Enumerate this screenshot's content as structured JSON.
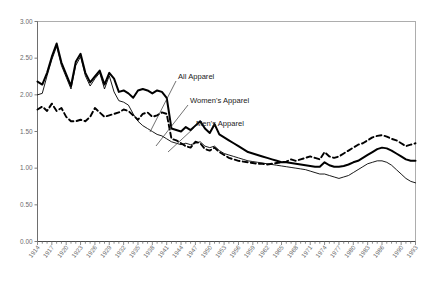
{
  "chart_data": {
    "type": "line",
    "title": "",
    "xlabel": "",
    "ylabel": "",
    "ylim": [
      0,
      3.0
    ],
    "yticks": [
      "0.00",
      "0.50",
      "1.00",
      "1.50",
      "2.00",
      "2.50",
      "3.00"
    ],
    "ytick_values": [
      0,
      0.5,
      1.0,
      1.5,
      2.0,
      2.5,
      3.0
    ],
    "grid": false,
    "legend_position": "inline-annotations",
    "xlim": [
      1914,
      1993
    ],
    "x": [
      1914,
      1915,
      1916,
      1917,
      1918,
      1919,
      1920,
      1921,
      1922,
      1923,
      1924,
      1925,
      1926,
      1927,
      1928,
      1929,
      1930,
      1931,
      1932,
      1933,
      1934,
      1935,
      1936,
      1937,
      1938,
      1939,
      1940,
      1941,
      1942,
      1943,
      1944,
      1945,
      1946,
      1947,
      1948,
      1949,
      1950,
      1951,
      1952,
      1953,
      1954,
      1955,
      1956,
      1957,
      1958,
      1959,
      1960,
      1961,
      1962,
      1963,
      1964,
      1965,
      1966,
      1967,
      1968,
      1969,
      1970,
      1971,
      1972,
      1973,
      1974,
      1975,
      1976,
      1977,
      1978,
      1979,
      1980,
      1981,
      1982,
      1983,
      1984,
      1985,
      1986,
      1987,
      1988,
      1989,
      1990,
      1991,
      1992,
      1993
    ],
    "xtick_labels": [
      "1914",
      "1917",
      "1920",
      "1923",
      "1926",
      "1929",
      "1932",
      "1935",
      "1938",
      "1941",
      "1944",
      "1947",
      "1950",
      "1953",
      "1956",
      "1959",
      "1962",
      "1965",
      "1968",
      "1971",
      "1974",
      "1977",
      "1980",
      "1983",
      "1986",
      "1990",
      "1993"
    ],
    "xtick_years": [
      1914,
      1917,
      1920,
      1923,
      1926,
      1929,
      1932,
      1935,
      1938,
      1941,
      1944,
      1947,
      1950,
      1953,
      1956,
      1959,
      1962,
      1965,
      1968,
      1971,
      1974,
      1977,
      1980,
      1983,
      1986,
      1990,
      1993
    ],
    "series": [
      {
        "name": "All Apparel",
        "style": "thick-solid",
        "color": "#000000",
        "values": [
          2.18,
          2.14,
          2.3,
          2.52,
          2.7,
          2.44,
          2.28,
          2.12,
          2.45,
          2.56,
          2.3,
          2.17,
          2.25,
          2.33,
          2.14,
          2.3,
          2.22,
          2.04,
          2.06,
          2.02,
          1.96,
          2.06,
          2.08,
          2.06,
          2.02,
          2.06,
          2.04,
          1.96,
          1.54,
          1.52,
          1.5,
          1.56,
          1.52,
          1.58,
          1.64,
          1.54,
          1.48,
          1.6,
          1.46,
          1.42,
          1.38,
          1.34,
          1.3,
          1.26,
          1.22,
          1.2,
          1.18,
          1.16,
          1.14,
          1.12,
          1.1,
          1.08,
          1.08,
          1.07,
          1.06,
          1.05,
          1.04,
          1.03,
          1.02,
          1.02,
          1.08,
          1.04,
          1.02,
          1.02,
          1.03,
          1.05,
          1.08,
          1.1,
          1.14,
          1.18,
          1.22,
          1.26,
          1.28,
          1.27,
          1.24,
          1.2,
          1.16,
          1.12,
          1.1,
          1.1
        ]
      },
      {
        "name": "Women's Apparel",
        "style": "thin-solid",
        "color": "#000000",
        "values": [
          2.0,
          2.02,
          2.26,
          2.48,
          2.66,
          2.4,
          2.24,
          2.08,
          2.4,
          2.52,
          2.26,
          2.12,
          2.22,
          2.3,
          2.08,
          2.26,
          2.04,
          1.92,
          1.9,
          1.86,
          1.74,
          1.64,
          1.58,
          1.54,
          1.5,
          1.46,
          1.44,
          1.4,
          1.36,
          1.34,
          1.32,
          1.34,
          1.32,
          1.34,
          1.36,
          1.3,
          1.28,
          1.3,
          1.24,
          1.2,
          1.18,
          1.16,
          1.14,
          1.12,
          1.1,
          1.09,
          1.08,
          1.07,
          1.06,
          1.05,
          1.04,
          1.03,
          1.02,
          1.01,
          1.0,
          0.99,
          0.98,
          0.96,
          0.94,
          0.92,
          0.92,
          0.9,
          0.88,
          0.86,
          0.88,
          0.9,
          0.94,
          0.98,
          1.02,
          1.06,
          1.08,
          1.1,
          1.1,
          1.08,
          1.04,
          0.98,
          0.92,
          0.86,
          0.82,
          0.8
        ]
      },
      {
        "name": "Men's Apparel",
        "style": "dashed",
        "color": "#000000",
        "values": [
          1.8,
          1.84,
          1.78,
          1.88,
          1.78,
          1.82,
          1.7,
          1.64,
          1.64,
          1.66,
          1.64,
          1.7,
          1.82,
          1.76,
          1.7,
          1.72,
          1.74,
          1.76,
          1.8,
          1.78,
          1.72,
          1.66,
          1.74,
          1.76,
          1.7,
          1.72,
          1.76,
          1.74,
          1.4,
          1.38,
          1.34,
          1.3,
          1.28,
          1.36,
          1.34,
          1.26,
          1.24,
          1.28,
          1.22,
          1.18,
          1.14,
          1.12,
          1.1,
          1.09,
          1.08,
          1.07,
          1.06,
          1.06,
          1.05,
          1.06,
          1.07,
          1.08,
          1.09,
          1.12,
          1.1,
          1.12,
          1.14,
          1.16,
          1.14,
          1.12,
          1.22,
          1.16,
          1.14,
          1.16,
          1.2,
          1.24,
          1.28,
          1.32,
          1.34,
          1.38,
          1.42,
          1.44,
          1.45,
          1.43,
          1.4,
          1.38,
          1.34,
          1.3,
          1.32,
          1.34
        ]
      }
    ],
    "annotations": [
      {
        "label": "All Apparel",
        "text_x": 178,
        "text_y": 79,
        "line_x1": 176,
        "line_y1": 81,
        "line_x2": 150,
        "line_y2": 132
      },
      {
        "label": "Women's Apparel",
        "text_x": 190,
        "text_y": 103,
        "line_x1": 188,
        "line_y1": 105,
        "line_x2": 156,
        "line_y2": 146
      },
      {
        "label": "Men's Apparel",
        "text_x": 196,
        "text_y": 126,
        "line_x1": 194,
        "line_y1": 128,
        "line_x2": 168,
        "line_y2": 152
      }
    ]
  }
}
